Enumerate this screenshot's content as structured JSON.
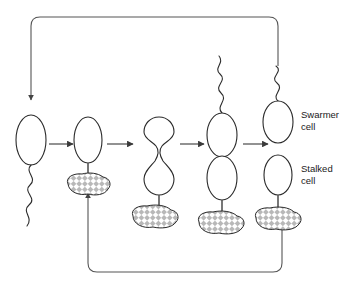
{
  "diagram": {
    "background_color": "#ffffff",
    "line_color": "#2a2a2a",
    "loop_color": "#555555",
    "holdfast_fill": "#ffffff",
    "holdfast_pattern_color": "#9a9a9a",
    "labels": {
      "swarmer": "Swarmer\ncell",
      "swarmer_line1": "Swarmer",
      "swarmer_line2": "cell",
      "stalked_line1": "Stalked",
      "stalked_line2": "cell"
    },
    "stages": [
      {
        "id": "stage-1",
        "name": "swarmer-cell-free-swimming",
        "has_flagellum": true,
        "has_stalk": false,
        "has_holdfast": false,
        "shape": "oval"
      },
      {
        "id": "stage-2",
        "name": "stalked-cell-attached",
        "has_flagellum": false,
        "has_stalk": true,
        "has_holdfast": true,
        "shape": "oval"
      },
      {
        "id": "stage-3",
        "name": "elongating-predivisional-cell",
        "has_flagellum": false,
        "has_stalk": true,
        "has_holdfast": true,
        "shape": "dumbbell"
      },
      {
        "id": "stage-4",
        "name": "predivisional-cell-with-flagellum",
        "has_flagellum": true,
        "has_stalk": true,
        "has_holdfast": true,
        "shape": "two-joined-ovals"
      },
      {
        "id": "stage-5",
        "name": "divided-swarmer-and-stalked-cells",
        "has_flagellum": true,
        "has_stalk": true,
        "has_holdfast": true,
        "shape": "two-separate-ovals"
      }
    ],
    "arrows": [
      {
        "name": "arrow-stage1-to-stage2",
        "from": "stage-1",
        "to": "stage-2"
      },
      {
        "name": "arrow-stage2-to-stage3",
        "from": "stage-2",
        "to": "stage-3"
      },
      {
        "name": "arrow-stage3-to-stage4",
        "from": "stage-3",
        "to": "stage-4"
      },
      {
        "name": "arrow-stage4-to-stage5",
        "from": "stage-4",
        "to": "stage-5"
      }
    ],
    "feedback_loops": [
      {
        "name": "swarmer-recycle-loop-top",
        "from": "stage-5-swarmer-cell",
        "to": "stage-1",
        "direction": "counter-clockwise-top"
      },
      {
        "name": "stalked-recycle-loop-bottom",
        "from": "stage-5-stalked-cell",
        "to": "stage-2",
        "direction": "clockwise-bottom"
      }
    ]
  }
}
